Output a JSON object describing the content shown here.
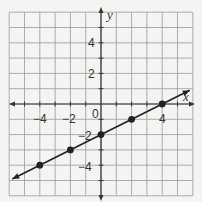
{
  "chart_data": {
    "type": "line",
    "title": "",
    "xlabel": "x",
    "ylabel": "y",
    "xlim": [
      -6,
      6
    ],
    "ylim": [
      -6,
      6
    ],
    "grid": true,
    "x_tick_labels": [
      "-4",
      "-2",
      "4"
    ],
    "y_tick_labels": [
      "4",
      "2",
      "-2",
      "-4"
    ],
    "origin_label": "0",
    "equation": "y = 0.5x - 2",
    "points": [
      {
        "x": -4,
        "y": -4
      },
      {
        "x": -2,
        "y": -3
      },
      {
        "x": 0,
        "y": -2
      },
      {
        "x": 2,
        "y": -1
      },
      {
        "x": 4,
        "y": 0
      }
    ],
    "line_extent": {
      "x_start": -5.8,
      "y_start": -4.9,
      "x_end": 5.8,
      "y_end": 0.9
    }
  },
  "labels": {
    "x_axis": "x",
    "y_axis": "y",
    "origin": "0",
    "xt_m4": "−4",
    "xt_m2": "−2",
    "xt_4": "4",
    "yt_4": "4",
    "yt_2": "2",
    "yt_m2": "−2",
    "yt_m4": "−4"
  }
}
